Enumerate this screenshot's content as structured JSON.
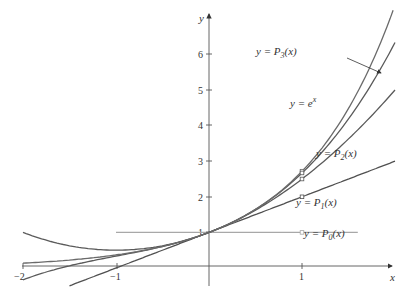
{
  "chart_data": {
    "type": "line",
    "title": "",
    "xlabel": "x",
    "ylabel": "y",
    "xlim": [
      -2,
      2
    ],
    "ylim": [
      0,
      7
    ],
    "x_ticks": [
      -2,
      -1,
      1
    ],
    "x_tick_labels": [
      "−2",
      "−1",
      "1"
    ],
    "y_ticks": [
      1,
      2,
      3,
      4,
      5,
      6
    ],
    "y_tick_labels": [
      "1",
      "2",
      "3",
      "4",
      "5",
      "6"
    ],
    "grid": false,
    "legend": "inline labels",
    "series": [
      {
        "name": "y = e^x",
        "label_parts": [
          "y = e",
          "x"
        ],
        "formula": "exp",
        "x_range": [
          -2,
          1.98
        ],
        "color": "#6a6a6a",
        "points": [
          [
            -2,
            0.14
          ],
          [
            -1,
            0.37
          ],
          [
            0,
            1
          ],
          [
            1,
            2.72
          ],
          [
            2,
            7.39
          ]
        ],
        "marked_point": [
          1,
          2.72
        ]
      },
      {
        "name": "y = P0(x)",
        "label_parts": [
          "y = P",
          "0",
          "(x)"
        ],
        "formula": "p0",
        "x_range": [
          -1,
          1.6
        ],
        "color": "#a8a8a8",
        "points": [
          [
            -1,
            1
          ],
          [
            0,
            1
          ],
          [
            1,
            1
          ]
        ],
        "marked_point": [
          1,
          1
        ]
      },
      {
        "name": "y = P1(x)",
        "label_parts": [
          "y = P",
          "1",
          "(x)"
        ],
        "formula": "p1",
        "x_range": [
          -1.5,
          2
        ],
        "color": "#505050",
        "points": [
          [
            -1,
            0
          ],
          [
            0,
            1
          ],
          [
            1,
            2
          ],
          [
            2,
            3
          ]
        ],
        "marked_point": [
          1,
          2
        ]
      },
      {
        "name": "y = P2(x)",
        "label_parts": [
          "y = P",
          "2",
          "(x)"
        ],
        "formula": "p2",
        "x_range": [
          -2,
          2
        ],
        "color": "#5a5a5a",
        "points": [
          [
            -2,
            1
          ],
          [
            -1,
            0.5
          ],
          [
            0,
            1
          ],
          [
            1,
            2.5
          ],
          [
            2,
            5
          ]
        ],
        "marked_point": [
          1,
          2.5
        ]
      },
      {
        "name": "y = P3(x)",
        "label_parts": [
          "y = P",
          "3",
          "(x)"
        ],
        "formula": "p3",
        "x_range": [
          -2,
          2
        ],
        "color": "#5a5a5a",
        "points": [
          [
            -2,
            -0.33
          ],
          [
            -1,
            0.33
          ],
          [
            0,
            1
          ],
          [
            1,
            2.67
          ],
          [
            2,
            6.33
          ]
        ],
        "marked_point": [
          1,
          2.67
        ]
      }
    ],
    "annotations": [
      {
        "text": "y = P3(x)",
        "pos": [
          256,
          55
        ],
        "arrow_from": [
          347,
          58
        ],
        "arrow_to": [
          382,
          74
        ]
      },
      {
        "text": "y = e^x",
        "pos": [
          290,
          104
        ]
      },
      {
        "text": "y = P2(x)",
        "pos": [
          316,
          154
        ]
      },
      {
        "text": "y = P1(x)",
        "pos": [
          296,
          203
        ]
      },
      {
        "text": "y = P0(x)",
        "pos": [
          304,
          234
        ]
      }
    ]
  },
  "labels": {
    "x_axis": "x",
    "y_axis": "y",
    "P3": {
      "pre": "y = P",
      "sub": "3",
      "post": "(x)"
    },
    "ex": {
      "pre": "y = e",
      "sup": "x"
    },
    "P2": {
      "pre": "y = P",
      "sub": "2",
      "post": "(x)"
    },
    "P1": {
      "pre": "y = P",
      "sub": "1",
      "post": "(x)"
    },
    "P0": {
      "pre": "y = P",
      "sub": "0",
      "post": "(x)"
    }
  },
  "ticks": {
    "x": [
      "−2",
      "−1",
      "1"
    ],
    "y": [
      "1",
      "2",
      "3",
      "4",
      "5",
      "6"
    ]
  },
  "colors": {
    "axis": "#555555",
    "ex": "#6a6a6a",
    "p0": "#a8a8a8",
    "p1": "#505050",
    "p2": "#5a5a5a",
    "p3": "#5a5a5a"
  }
}
